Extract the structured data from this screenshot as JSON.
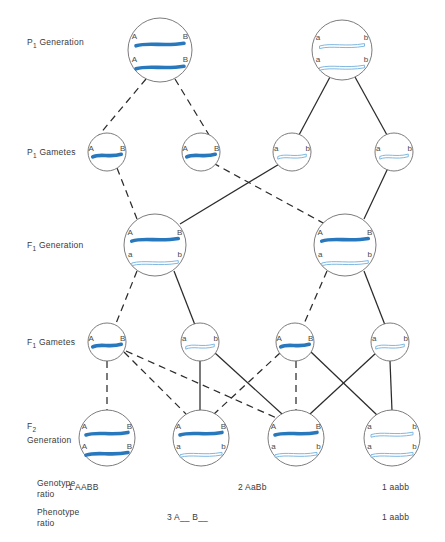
{
  "figure": {
    "type": "genetics-pedigree-diagram",
    "width": 445,
    "height": 542
  },
  "colors": {
    "dominant_chromosome": "#2878be",
    "recessive_chromosome_stroke": "#7fb8e0",
    "recessive_chromosome_fill": "#ffffff",
    "circle_stroke": "#6d6d6d",
    "line": "#2b2b2b",
    "text": "#3a3a3a",
    "background": "#ffffff"
  },
  "row_labels": [
    {
      "id": "p1-generation",
      "text": "P",
      "sub": "1",
      "rest": " Generation",
      "x": 27,
      "y": 37
    },
    {
      "id": "p1-gametes",
      "text": "P",
      "sub": "1",
      "rest": " Gametes",
      "x": 27,
      "y": 147
    },
    {
      "id": "f1-generation",
      "text": "F",
      "sub": "1",
      "rest": " Generation",
      "x": 27,
      "y": 240
    },
    {
      "id": "f1-gametes",
      "text": "F",
      "sub": "1",
      "rest": " Gametes",
      "x": 27,
      "y": 337
    },
    {
      "id": "f2-generation",
      "text": "F",
      "sub": "2",
      "rest": " Generation",
      "x": 27,
      "y": 427
    }
  ],
  "alleles": {
    "dominant_a": "A",
    "dominant_b": "B",
    "recessive_a": "a",
    "recessive_b": "b"
  },
  "rows": {
    "p1_generation": {
      "label": "P1 Generation",
      "cells": [
        {
          "id": "p1-parent-left",
          "cx": 160,
          "cy": 50,
          "r": 32,
          "chromosomes": [
            {
              "type": "dominant",
              "left": "A",
              "right": "B"
            },
            {
              "type": "dominant",
              "left": "A",
              "right": "B"
            }
          ]
        },
        {
          "id": "p1-parent-right",
          "cx": 342,
          "cy": 50,
          "r": 30,
          "chromosomes": [
            {
              "type": "recessive",
              "left": "a",
              "right": "b"
            },
            {
              "type": "recessive",
              "left": "a",
              "right": "b"
            }
          ]
        }
      ]
    },
    "p1_gametes": {
      "label": "P1 Gametes",
      "cells": [
        {
          "id": "p1-gamete-1",
          "cx": 107,
          "cy": 152,
          "r": 19,
          "chromosomes": [
            {
              "type": "dominant",
              "left": "A",
              "right": "B"
            }
          ]
        },
        {
          "id": "p1-gamete-2",
          "cx": 201,
          "cy": 152,
          "r": 19,
          "chromosomes": [
            {
              "type": "dominant",
              "left": "A",
              "right": "B"
            }
          ]
        },
        {
          "id": "p1-gamete-3",
          "cx": 292,
          "cy": 152,
          "r": 19,
          "chromosomes": [
            {
              "type": "recessive",
              "left": "a",
              "right": "b"
            }
          ]
        },
        {
          "id": "p1-gamete-4",
          "cx": 394,
          "cy": 152,
          "r": 19,
          "chromosomes": [
            {
              "type": "recessive",
              "left": "a",
              "right": "b"
            }
          ]
        }
      ]
    },
    "f1_generation": {
      "label": "F1 Generation",
      "cells": [
        {
          "id": "f1-left",
          "cx": 155,
          "cy": 245,
          "r": 31,
          "chromosomes": [
            {
              "type": "dominant",
              "left": "A",
              "right": "B"
            },
            {
              "type": "recessive",
              "left": "a",
              "right": "b"
            }
          ]
        },
        {
          "id": "f1-right",
          "cx": 345,
          "cy": 245,
          "r": 31,
          "chromosomes": [
            {
              "type": "dominant",
              "left": "A",
              "right": "B"
            },
            {
              "type": "recessive",
              "left": "a",
              "right": "b"
            }
          ]
        }
      ]
    },
    "f1_gametes": {
      "label": "F1 Gametes",
      "cells": [
        {
          "id": "f1-gamete-1",
          "cx": 107,
          "cy": 342,
          "r": 19,
          "chromosomes": [
            {
              "type": "dominant",
              "left": "A",
              "right": "B"
            }
          ]
        },
        {
          "id": "f1-gamete-2",
          "cx": 200,
          "cy": 342,
          "r": 19,
          "chromosomes": [
            {
              "type": "recessive",
              "left": "a",
              "right": "b"
            }
          ]
        },
        {
          "id": "f1-gamete-3",
          "cx": 295,
          "cy": 342,
          "r": 19,
          "chromosomes": [
            {
              "type": "dominant",
              "left": "A",
              "right": "B"
            }
          ]
        },
        {
          "id": "f1-gamete-4",
          "cx": 390,
          "cy": 342,
          "r": 19,
          "chromosomes": [
            {
              "type": "recessive",
              "left": "a",
              "right": "b"
            }
          ]
        }
      ]
    },
    "f2_generation": {
      "label": "F2 Generation",
      "cells": [
        {
          "id": "f2-1",
          "cx": 107,
          "cy": 438,
          "r": 28,
          "genotype": "AABB",
          "chromosomes": [
            {
              "type": "dominant",
              "left": "A",
              "right": "B"
            },
            {
              "type": "dominant",
              "left": "A",
              "right": "B"
            }
          ]
        },
        {
          "id": "f2-2",
          "cx": 201,
          "cy": 438,
          "r": 28,
          "genotype": "AaBb",
          "chromosomes": [
            {
              "type": "dominant",
              "left": "A",
              "right": "B"
            },
            {
              "type": "recessive",
              "left": "a",
              "right": "b"
            }
          ]
        },
        {
          "id": "f2-3",
          "cx": 296,
          "cy": 438,
          "r": 28,
          "genotype": "AaBb",
          "chromosomes": [
            {
              "type": "dominant",
              "left": "A",
              "right": "B"
            },
            {
              "type": "recessive",
              "left": "a",
              "right": "b"
            }
          ]
        },
        {
          "id": "f2-4",
          "cx": 392,
          "cy": 438,
          "r": 28,
          "genotype": "aabb",
          "chromosomes": [
            {
              "type": "recessive",
              "left": "a",
              "right": "b"
            },
            {
              "type": "recessive",
              "left": "a",
              "right": "b"
            }
          ]
        }
      ]
    }
  },
  "links": [
    {
      "id": "p1l-g1",
      "from": "p1-parent-left",
      "to": "p1-gamete-1",
      "style": "dashed",
      "x1": 146,
      "y1": 79,
      "x2": 99,
      "y2": 135
    },
    {
      "id": "p1l-g2",
      "from": "p1-parent-left",
      "to": "p1-gamete-2",
      "style": "dashed",
      "x1": 175,
      "y1": 79,
      "x2": 209,
      "y2": 135
    },
    {
      "id": "p1r-g3",
      "from": "p1-parent-right",
      "to": "p1-gamete-3",
      "style": "solid",
      "x1": 330,
      "y1": 77,
      "x2": 299,
      "y2": 135
    },
    {
      "id": "p1r-g4",
      "from": "p1-parent-right",
      "to": "p1-gamete-4",
      "style": "solid",
      "x1": 355,
      "y1": 77,
      "x2": 387,
      "y2": 135
    },
    {
      "id": "g1-f1l",
      "from": "p1-gamete-1",
      "to": "f1-left",
      "style": "dashed",
      "x1": 117,
      "y1": 168,
      "x2": 137,
      "y2": 219
    },
    {
      "id": "g3-f1l",
      "from": "p1-gamete-3",
      "to": "f1-left",
      "style": "solid",
      "x1": 281,
      "y1": 163,
      "x2": 180,
      "y2": 224
    },
    {
      "id": "g2-f1r",
      "from": "p1-gamete-2",
      "to": "f1-right",
      "style": "dashed",
      "x1": 213,
      "y1": 163,
      "x2": 325,
      "y2": 224
    },
    {
      "id": "g4-f1r",
      "from": "p1-gamete-4",
      "to": "f1-right",
      "style": "solid",
      "x1": 388,
      "y1": 168,
      "x2": 364,
      "y2": 219
    },
    {
      "id": "f1l-fg1",
      "from": "f1-left",
      "to": "f1-gamete-1",
      "style": "dashed",
      "x1": 137,
      "y1": 271,
      "x2": 115,
      "y2": 326
    },
    {
      "id": "f1l-fg2",
      "from": "f1-left",
      "to": "f1-gamete-2",
      "style": "solid",
      "x1": 174,
      "y1": 271,
      "x2": 195,
      "y2": 325
    },
    {
      "id": "f1r-fg3",
      "from": "f1-right",
      "to": "f1-gamete-3",
      "style": "dashed",
      "x1": 327,
      "y1": 271,
      "x2": 303,
      "y2": 326
    },
    {
      "id": "f1r-fg4",
      "from": "f1-right",
      "to": "f1-gamete-4",
      "style": "solid",
      "x1": 364,
      "y1": 271,
      "x2": 385,
      "y2": 325
    },
    {
      "id": "fg1-f2-1",
      "from": "f1-gamete-1",
      "to": "f2-1",
      "style": "dashed",
      "x1": 107,
      "y1": 361,
      "x2": 107,
      "y2": 411
    },
    {
      "id": "fg1-f2-2",
      "from": "f1-gamete-1",
      "to": "f2-2",
      "style": "dashed",
      "x1": 124,
      "y1": 352,
      "x2": 186,
      "y2": 414
    },
    {
      "id": "fg2-f2-2",
      "from": "f1-gamete-2",
      "to": "f2-2",
      "style": "solid",
      "x1": 200,
      "y1": 361,
      "x2": 200,
      "y2": 411
    },
    {
      "id": "fg2-f2-3",
      "from": "f1-gamete-2",
      "to": "f2-3",
      "style": "solid",
      "x1": 215,
      "y1": 353,
      "x2": 282,
      "y2": 414
    },
    {
      "id": "fg3-f2-2",
      "from": "f1-gamete-3",
      "to": "f2-2",
      "style": "dashed",
      "x1": 280,
      "y1": 353,
      "x2": 214,
      "y2": 414
    },
    {
      "id": "fg3-f2-3",
      "from": "f1-gamete-3",
      "to": "f2-3",
      "style": "dashed",
      "x1": 296,
      "y1": 361,
      "x2": 296,
      "y2": 411
    },
    {
      "id": "fg4-f2-3",
      "from": "f1-gamete-4",
      "to": "f2-3",
      "style": "solid",
      "x1": 376,
      "y1": 353,
      "x2": 310,
      "y2": 414
    },
    {
      "id": "fg4-f2-4",
      "from": "f1-gamete-4",
      "to": "f2-4",
      "style": "solid",
      "x1": 390,
      "y1": 361,
      "x2": 392,
      "y2": 411
    },
    {
      "id": "fg1-f2-4-cross",
      "from": "f1-gamete-1",
      "to": "f2-4",
      "style": "dashed",
      "x1": 126,
      "y1": 351,
      "x2": 281,
      "y2": 420
    },
    {
      "id": "fg3-f2-4-cross",
      "from": "f1-gamete-3",
      "to": "f2-4",
      "style": "solid",
      "x1": 311,
      "y1": 352,
      "x2": 377,
      "y2": 415
    }
  ],
  "ratios": {
    "genotype": {
      "label": "Genotype\nratio",
      "label_x": 37,
      "label_y": 478,
      "values": [
        {
          "id": "genotype-ratio-1",
          "text": "1 AABB",
          "x": 68,
          "y": 482
        },
        {
          "id": "genotype-ratio-2",
          "text": "2 AaBb",
          "x": 238,
          "y": 482
        },
        {
          "id": "genotype-ratio-3",
          "text": "1 aabb",
          "x": 382,
          "y": 482
        }
      ]
    },
    "phenotype": {
      "label": "Phenotype\nratio",
      "label_x": 37,
      "label_y": 507,
      "values": [
        {
          "id": "phenotype-ratio-1",
          "text": "3 A__ B__",
          "x": 167,
          "y": 512
        },
        {
          "id": "phenotype-ratio-2",
          "text": "1 aabb",
          "x": 382,
          "y": 512
        }
      ]
    }
  }
}
